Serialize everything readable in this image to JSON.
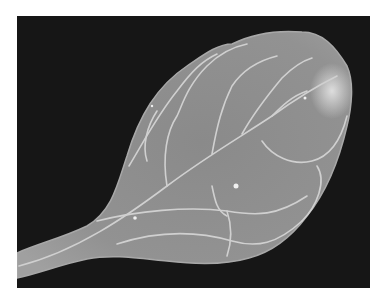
{
  "image": {
    "subject": "leaf",
    "description": "Grayscale photograph of a single obovate leaf with petiole, showing a light venation network against a black background",
    "colors": {
      "background": "#161616",
      "leaf": "#8e8e8e",
      "veins": "#d2d2d2",
      "border": "#ffffff"
    }
  }
}
